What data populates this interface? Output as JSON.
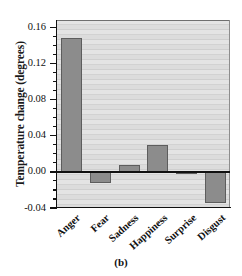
{
  "figure": {
    "caption": "(b)"
  },
  "chart_data": {
    "type": "bar",
    "title": "",
    "subtitle": "",
    "xlabel": "",
    "ylabel": "Temperature change (degrees)",
    "categories": [
      "Anger",
      "Fear",
      "Sadness",
      "Happiness",
      "Surprise",
      "Disgust"
    ],
    "values": [
      0.148,
      -0.012,
      0.008,
      0.03,
      -0.002,
      -0.035
    ],
    "series": [
      {
        "name": "Temperature change",
        "values": [
          0.148,
          -0.012,
          0.008,
          0.03,
          -0.002,
          -0.035
        ]
      }
    ],
    "ylim": [
      -0.04,
      0.168
    ],
    "ytick_values": [
      0.16,
      0.12,
      0.08,
      0.04,
      0.0,
      -0.04
    ],
    "ytick_labels": [
      "0.16",
      "0.12",
      "0.08",
      "0.04",
      "0.00",
      "-0.04"
    ],
    "yminor_tick_interval": 0.01,
    "grid": true,
    "grid_orientation": "horizontal",
    "legend": false,
    "legend_position": "none",
    "bar_color": "#8c8c8c",
    "bar_edge_color": "#5d5d5d",
    "plot_background": "#d8d8d8",
    "axis_color": "#111111",
    "annotations": []
  }
}
